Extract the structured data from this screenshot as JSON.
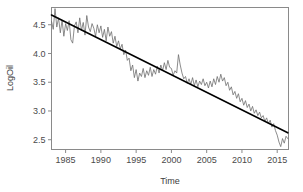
{
  "chart_data": {
    "type": "line",
    "title": "",
    "subtitle": "",
    "xlabel": "Time",
    "ylabel": "LogOil",
    "xlim": [
      1983.0,
      2016.6
    ],
    "ylim": [
      2.33,
      4.8
    ],
    "grid": false,
    "legend": null,
    "xticks": [
      1985,
      1990,
      1995,
      2000,
      2005,
      2010,
      2015
    ],
    "xtick_labels": [
      "1985",
      "1990",
      "1995",
      "2000",
      "2005",
      "2010",
      "2015"
    ],
    "yticks": [
      2.5,
      3.0,
      3.5,
      4.0,
      4.5
    ],
    "ytick_labels": [
      "2.5",
      "3.0",
      "3.5",
      "4.0",
      "4.5"
    ],
    "series": [
      {
        "name": "LogOil",
        "kind": "line",
        "color": "#6e6e6e",
        "linewidth": 0.8,
        "x": [
          1983.0,
          1983.25,
          1983.5,
          1983.75,
          1984.0,
          1984.25,
          1984.5,
          1984.75,
          1985.0,
          1985.25,
          1985.5,
          1985.75,
          1986.0,
          1986.25,
          1986.5,
          1986.75,
          1987.0,
          1987.25,
          1987.5,
          1987.75,
          1988.0,
          1988.25,
          1988.5,
          1988.75,
          1989.0,
          1989.25,
          1989.5,
          1989.75,
          1990.0,
          1990.25,
          1990.5,
          1990.75,
          1991.0,
          1991.25,
          1991.5,
          1991.75,
          1992.0,
          1992.25,
          1992.5,
          1992.75,
          1993.0,
          1993.25,
          1993.5,
          1993.75,
          1994.0,
          1994.25,
          1994.5,
          1994.75,
          1995.0,
          1995.25,
          1995.5,
          1995.75,
          1996.0,
          1996.25,
          1996.5,
          1996.75,
          1997.0,
          1997.25,
          1997.5,
          1997.75,
          1998.0,
          1998.25,
          1998.5,
          1998.75,
          1999.0,
          1999.25,
          1999.5,
          1999.75,
          2000.0,
          2000.25,
          2000.5,
          2000.75,
          2001.0,
          2001.25,
          2001.5,
          2001.75,
          2002.0,
          2002.25,
          2002.5,
          2002.75,
          2003.0,
          2003.25,
          2003.5,
          2003.75,
          2004.0,
          2004.25,
          2004.5,
          2004.75,
          2005.0,
          2005.25,
          2005.5,
          2005.75,
          2006.0,
          2006.25,
          2006.5,
          2006.75,
          2007.0,
          2007.25,
          2007.5,
          2007.75,
          2008.0,
          2008.25,
          2008.5,
          2008.75,
          2009.0,
          2009.25,
          2009.5,
          2009.75,
          2010.0,
          2010.25,
          2010.5,
          2010.75,
          2011.0,
          2011.25,
          2011.5,
          2011.75,
          2012.0,
          2012.25,
          2012.5,
          2012.75,
          2013.0,
          2013.25,
          2013.5,
          2013.75,
          2014.0,
          2014.25,
          2014.5,
          2014.75,
          2015.0,
          2015.25,
          2015.5,
          2015.75,
          2016.0,
          2016.25,
          2016.5
        ],
        "y": [
          4.56,
          4.42,
          4.78,
          4.46,
          4.62,
          4.36,
          4.58,
          4.3,
          4.52,
          4.4,
          4.57,
          4.24,
          4.18,
          4.48,
          4.55,
          4.36,
          4.62,
          4.4,
          4.54,
          4.32,
          4.66,
          4.46,
          4.38,
          4.52,
          4.44,
          4.3,
          4.5,
          4.36,
          4.48,
          4.28,
          4.42,
          4.22,
          4.46,
          4.3,
          4.38,
          4.18,
          4.3,
          4.12,
          4.22,
          4.08,
          4.16,
          3.98,
          4.06,
          3.88,
          3.92,
          3.7,
          3.8,
          3.58,
          3.72,
          3.52,
          3.66,
          3.6,
          3.74,
          3.58,
          3.7,
          3.62,
          3.76,
          3.6,
          3.72,
          3.64,
          3.78,
          3.66,
          3.8,
          3.7,
          3.84,
          3.72,
          3.88,
          3.76,
          3.74,
          3.62,
          3.7,
          3.66,
          3.98,
          3.8,
          3.66,
          3.56,
          3.6,
          3.48,
          3.56,
          3.46,
          3.58,
          3.44,
          3.54,
          3.42,
          3.52,
          3.46,
          3.56,
          3.44,
          3.5,
          3.4,
          3.52,
          3.42,
          3.56,
          3.46,
          3.6,
          3.5,
          3.64,
          3.52,
          3.58,
          3.44,
          3.5,
          3.36,
          3.42,
          3.28,
          3.34,
          3.22,
          3.3,
          3.16,
          3.22,
          3.1,
          3.18,
          3.06,
          3.12,
          3.0,
          3.08,
          2.96,
          3.02,
          2.92,
          2.98,
          2.88,
          2.92,
          2.82,
          2.88,
          2.78,
          2.84,
          2.72,
          2.78,
          2.66,
          2.58,
          2.46,
          2.38,
          2.52,
          2.44,
          2.56,
          2.52
        ]
      },
      {
        "name": "Linear trend",
        "kind": "trend",
        "color": "#000000",
        "linewidth": 1.6,
        "x": [
          1983.0,
          2016.5
        ],
        "y": [
          4.67,
          2.62
        ]
      }
    ]
  },
  "panel": {
    "border_color": "#8a8a8a",
    "background": "#ffffff"
  }
}
